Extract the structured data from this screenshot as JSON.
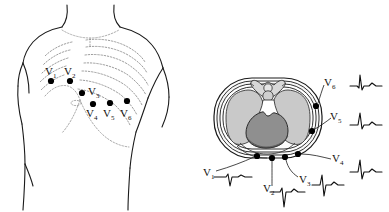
{
  "figure": {
    "panels": [
      {
        "id": "anterior-chest",
        "name": "Anterior chest wall with V1-V6 electrode sites"
      },
      {
        "id": "transverse-section",
        "name": "Transverse thoracic section with V1-V6 electrodes and ECG traces"
      }
    ]
  },
  "leads": [
    {
      "id": "V1",
      "label": "V",
      "sub": "1"
    },
    {
      "id": "V2",
      "label": "V",
      "sub": "2"
    },
    {
      "id": "V3",
      "label": "V",
      "sub": "3"
    },
    {
      "id": "V4",
      "label": "V",
      "sub": "4"
    },
    {
      "id": "V5",
      "label": "V",
      "sub": "5"
    },
    {
      "id": "V6",
      "label": "V",
      "sub": "6"
    }
  ],
  "chest_electrodes": [
    {
      "id": "V1",
      "x": 51,
      "y": 81,
      "label_x": 45,
      "label_y": 73
    },
    {
      "id": "V2",
      "x": 70,
      "y": 81,
      "label_x": 64,
      "label_y": 73
    },
    {
      "id": "V3",
      "x": 82,
      "y": 93,
      "label_x": 88,
      "label_y": 93
    },
    {
      "id": "V4",
      "x": 93,
      "y": 104,
      "label_x": 87,
      "label_y": 115
    },
    {
      "id": "V5",
      "x": 110,
      "y": 103,
      "label_x": 104,
      "label_y": 115
    },
    {
      "id": "V6",
      "x": 127,
      "y": 101,
      "label_x": 121,
      "label_y": 115
    }
  ],
  "section_electrodes": [
    {
      "id": "V1",
      "x": 257,
      "y": 155,
      "label_x": 205,
      "label_y": 174
    },
    {
      "id": "V2",
      "x": 272,
      "y": 157,
      "label_x": 265,
      "label_y": 190
    },
    {
      "id": "V3",
      "x": 285,
      "y": 156,
      "label_x": 301,
      "label_y": 181
    },
    {
      "id": "V4",
      "x": 298,
      "y": 153,
      "label_x": 333,
      "label_y": 160
    },
    {
      "id": "V5",
      "x": 312,
      "y": 130,
      "label_x": 331,
      "label_y": 119
    },
    {
      "id": "V6",
      "x": 316,
      "y": 105,
      "label_x": 325,
      "label_y": 84
    }
  ],
  "ecg_traces": [
    {
      "id": "V1",
      "morphology": "small r, deep S (rS)",
      "x": 222,
      "y": 176,
      "r_amp": 3,
      "s_amp": 9
    },
    {
      "id": "V2",
      "morphology": "small r, deep S (rS)",
      "x": 282,
      "y": 193,
      "r_amp": 4,
      "s_amp": 14
    },
    {
      "id": "V3",
      "morphology": "equiphasic RS transition",
      "x": 322,
      "y": 184,
      "r_amp": 9,
      "s_amp": 10
    },
    {
      "id": "V4",
      "morphology": "tall R, small s (Rs)",
      "x": 362,
      "y": 171,
      "r_amp": 12,
      "s_amp": 6
    },
    {
      "id": "V5",
      "morphology": "tall R, small s (Rs)",
      "x": 362,
      "y": 124,
      "r_amp": 11,
      "s_amp": 3
    },
    {
      "id": "V6",
      "morphology": "tall R, small s (qRs)",
      "x": 362,
      "y": 85,
      "r_amp": 10,
      "s_amp": 2
    }
  ],
  "anatomy": [
    {
      "id": "lung-right",
      "name": "Right lung"
    },
    {
      "id": "lung-left",
      "name": "Left lung"
    },
    {
      "id": "heart",
      "name": "Heart"
    },
    {
      "id": "vertebra",
      "name": "Thoracic vertebra"
    },
    {
      "id": "chest-wall",
      "name": "Chest wall"
    },
    {
      "id": "torso",
      "name": "Torso outline"
    },
    {
      "id": "ribs",
      "name": "Rib cage (dotted)"
    }
  ],
  "colors": {
    "outline": "#1a1a1a",
    "rib_dotted": "#8a8a8a",
    "lung_fill": "#c9c9c9",
    "heart_fill": "#8f8f8f",
    "chest_wall_fill": "#f4f4f4",
    "vertebra_fill": "#d8d8d8",
    "electrode": "#000000",
    "trace": "#111111",
    "background": "#ffffff"
  }
}
